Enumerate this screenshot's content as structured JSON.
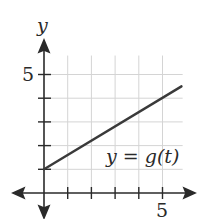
{
  "chart_data": {
    "type": "line",
    "title": "",
    "xlabel": "",
    "ylabel": "y",
    "xlim": [
      -1,
      6.2
    ],
    "ylim": [
      -1,
      5.8
    ],
    "grid": true,
    "x_ticks": [
      1,
      2,
      3,
      4,
      5
    ],
    "y_ticks": [
      1,
      2,
      3,
      4,
      5
    ],
    "x_tick_labels_shown": [
      "5"
    ],
    "y_tick_labels_shown": [
      "5"
    ],
    "series": [
      {
        "name": "y = g(t)",
        "x": [
          0,
          5.8
        ],
        "values": [
          1,
          4.5
        ],
        "color": "#3a3a3a"
      }
    ],
    "annotations": [
      {
        "text": "y = g(t)",
        "x": 3.6,
        "y": 1.2
      }
    ]
  },
  "labels": {
    "y_axis": "y",
    "y_tick_5": "5",
    "x_tick_5": "5",
    "curve_label": "y = g(t)"
  }
}
